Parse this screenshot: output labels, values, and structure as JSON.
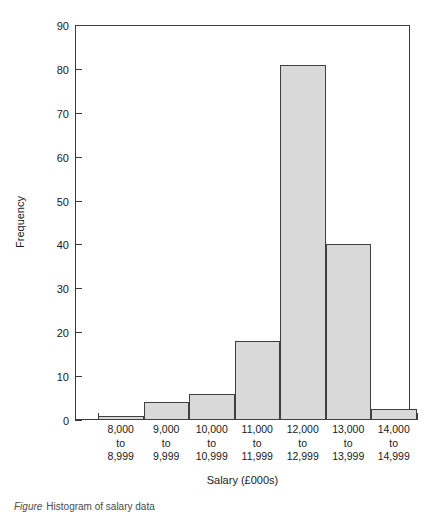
{
  "chart_data": {
    "type": "bar",
    "title": "",
    "subtitle": "",
    "xlabel": "Salary (£000s)",
    "ylabel": "Frequency",
    "categories": [
      "8,000 to 8,999",
      "9,000 to 9,999",
      "10,000 to 10,999",
      "11,000 to 11,999",
      "12,000 to 12,999",
      "13,000 to 13,999",
      "14,000 to 14,999"
    ],
    "category_lines": [
      [
        "8,000",
        "to",
        "8,999"
      ],
      [
        "9,000",
        "to",
        "9,999"
      ],
      [
        "10,000",
        "to",
        "10,999"
      ],
      [
        "11,000",
        "to",
        "11,999"
      ],
      [
        "12,000",
        "to",
        "12,999"
      ],
      [
        "13,000",
        "to",
        "13,999"
      ],
      [
        "14,000",
        "to",
        "14,999"
      ]
    ],
    "values": [
      1,
      4,
      6,
      18,
      81,
      40,
      2.5
    ],
    "ylim": [
      0,
      90
    ],
    "ytick_labels": [
      "0",
      "10",
      "20",
      "30",
      "40",
      "50",
      "60",
      "70",
      "80",
      "90"
    ],
    "ytick_values": [
      0,
      10,
      20,
      30,
      40,
      50,
      60,
      70,
      80,
      90
    ],
    "grid": false,
    "legend": false,
    "legend_position": "none",
    "bar_fill_color": "#d9d9d9",
    "bar_edge_color": "#3f3f3f",
    "axis_color": "#3a3a3a",
    "background_color": "#ffffff"
  },
  "axes": {
    "y_title": "Frequency",
    "x_title": "Salary (£000s)"
  },
  "caption": {
    "label": "Figure",
    "text": "Histogram of salary data"
  }
}
